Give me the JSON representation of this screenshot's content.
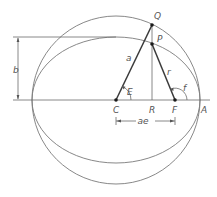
{
  "figure": {
    "colors": {
      "line": "#6a6a6a",
      "thick_line": "#3a3a3a",
      "point": "#1a1a1a",
      "label": "#555555",
      "background": "#ffffff"
    }
  },
  "labels": {
    "Q": "Q",
    "P": "P",
    "a": "a",
    "r": "r",
    "b": "b",
    "E": "E",
    "f": "f",
    "C": "C",
    "R": "R",
    "F": "F",
    "A": "A",
    "ae": "ae"
  },
  "geometry": {
    "center_C": [
      116,
      100
    ],
    "focus_F": [
      175,
      100
    ],
    "foot_R": [
      152,
      100
    ],
    "point_Q": [
      152,
      25
    ],
    "point_P": [
      152,
      44
    ],
    "apse_A": [
      199,
      100
    ],
    "circle_radius": 84,
    "ellipse_semi_major": 84,
    "ellipse_semi_minor": 63
  }
}
